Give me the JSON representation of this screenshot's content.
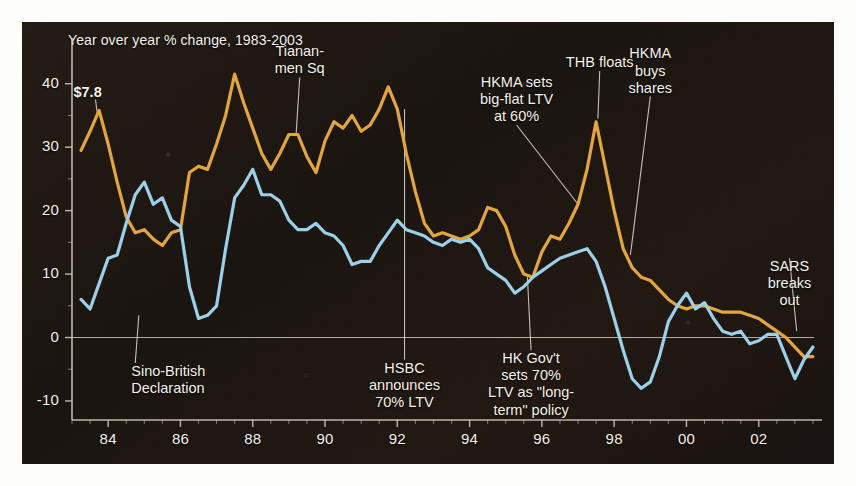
{
  "chart_data": {
    "type": "line",
    "title": "Year over year % change, 1983-2003",
    "xlabel": "",
    "ylabel": "",
    "xlim": [
      1983.0,
      2003.75
    ],
    "ylim": [
      -13,
      45
    ],
    "yticks": [
      40,
      30,
      20,
      10,
      0,
      -10
    ],
    "ytick_labels": [
      "40",
      "30",
      "20",
      "10",
      "0",
      "-10"
    ],
    "xticks": [
      1984,
      1986,
      1988,
      1990,
      1992,
      1994,
      1996,
      1998,
      2000,
      2002
    ],
    "xtick_labels": [
      "84",
      "86",
      "88",
      "90",
      "92",
      "94",
      "96",
      "98",
      "00",
      "02"
    ],
    "grid": false,
    "zero_line": true,
    "legend": "none",
    "colors": {
      "series_gold": "#e3a63e",
      "series_blue": "#9ccfe8",
      "background": "#1c1510",
      "axis": "#cfc8bd",
      "text": "#f4f1ea"
    },
    "series": [
      {
        "name": "gold-series",
        "color": "#e3a63e",
        "x": [
          1983.25,
          1983.5,
          1983.75,
          1984.0,
          1984.25,
          1984.5,
          1984.75,
          1985.0,
          1985.25,
          1985.5,
          1985.75,
          1986.0,
          1986.25,
          1986.5,
          1986.75,
          1987.0,
          1987.25,
          1987.5,
          1987.75,
          1988.0,
          1988.25,
          1988.5,
          1988.75,
          1989.0,
          1989.25,
          1989.5,
          1989.75,
          1990.0,
          1990.25,
          1990.5,
          1990.75,
          1991.0,
          1991.25,
          1991.5,
          1991.75,
          1992.0,
          1992.25,
          1992.5,
          1992.75,
          1993.0,
          1993.25,
          1993.5,
          1993.75,
          1994.0,
          1994.25,
          1994.5,
          1994.75,
          1995.0,
          1995.25,
          1995.5,
          1995.75,
          1996.0,
          1996.25,
          1996.5,
          1996.75,
          1997.0,
          1997.25,
          1997.5,
          1997.75,
          1998.0,
          1998.25,
          1998.5,
          1998.75,
          1999.0,
          1999.25,
          1999.5,
          1999.75,
          2000.0,
          2000.25,
          2000.5,
          2000.75,
          2001.0,
          2001.25,
          2001.5,
          2001.75,
          2002.0,
          2002.25,
          2002.5,
          2002.75,
          2003.0,
          2003.25,
          2003.5
        ],
        "y": [
          29.5,
          32.5,
          35.8,
          30.5,
          24.5,
          19.0,
          16.5,
          17.0,
          15.5,
          14.5,
          16.5,
          17.0,
          26.0,
          27.0,
          26.5,
          30.5,
          35.0,
          41.5,
          37.0,
          33.0,
          29.0,
          26.5,
          29.0,
          32.0,
          32.0,
          28.5,
          26.0,
          31.0,
          34.0,
          33.0,
          35.0,
          32.5,
          33.5,
          36.0,
          39.5,
          36.0,
          29.0,
          23.0,
          18.0,
          16.0,
          16.5,
          16.0,
          15.5,
          16.0,
          17.0,
          20.5,
          20.0,
          17.5,
          13.0,
          10.0,
          9.5,
          13.5,
          16.0,
          15.5,
          18.0,
          21.0,
          26.5,
          34.0,
          27.0,
          20.0,
          14.0,
          11.0,
          9.5,
          9.0,
          7.5,
          6.0,
          5.0,
          4.5,
          5.0,
          5.0,
          4.5,
          4.0,
          4.0,
          4.0,
          3.5,
          3.0,
          2.0,
          1.0,
          0.0,
          -1.5,
          -3.0,
          -3.0
        ]
      },
      {
        "name": "blue-series",
        "color": "#9ccfe8",
        "x": [
          1983.25,
          1983.5,
          1983.75,
          1984.0,
          1984.25,
          1984.5,
          1984.75,
          1985.0,
          1985.25,
          1985.5,
          1985.75,
          1986.0,
          1986.25,
          1986.5,
          1986.75,
          1987.0,
          1987.25,
          1987.5,
          1987.75,
          1988.0,
          1988.25,
          1988.5,
          1988.75,
          1989.0,
          1989.25,
          1989.5,
          1989.75,
          1990.0,
          1990.25,
          1990.5,
          1990.75,
          1991.0,
          1991.25,
          1991.5,
          1991.75,
          1992.0,
          1992.25,
          1992.5,
          1992.75,
          1993.0,
          1993.25,
          1993.5,
          1993.75,
          1994.0,
          1994.25,
          1994.5,
          1994.75,
          1995.0,
          1995.25,
          1995.5,
          1995.75,
          1996.0,
          1996.25,
          1996.5,
          1996.75,
          1997.0,
          1997.25,
          1997.5,
          1997.75,
          1998.0,
          1998.25,
          1998.5,
          1998.75,
          1999.0,
          1999.25,
          1999.5,
          1999.75,
          2000.0,
          2000.25,
          2000.5,
          2000.75,
          2001.0,
          2001.25,
          2001.5,
          2001.75,
          2002.0,
          2002.25,
          2002.5,
          2002.75,
          2003.0,
          2003.25,
          2003.5
        ],
        "y": [
          6.0,
          4.5,
          8.5,
          12.5,
          13.0,
          18.0,
          22.5,
          24.5,
          21.0,
          22.0,
          18.5,
          17.5,
          8.0,
          3.0,
          3.5,
          5.0,
          14.0,
          22.0,
          24.0,
          26.5,
          22.5,
          22.5,
          21.5,
          18.5,
          17.0,
          17.0,
          18.0,
          16.5,
          16.0,
          14.5,
          11.5,
          12.0,
          12.0,
          14.5,
          16.5,
          18.5,
          17.0,
          16.5,
          16.0,
          15.0,
          14.5,
          15.5,
          15.0,
          15.5,
          14.0,
          11.0,
          10.0,
          9.0,
          7.0,
          8.0,
          9.5,
          10.5,
          11.5,
          12.5,
          13.0,
          13.5,
          14.0,
          12.0,
          8.0,
          3.0,
          -2.0,
          -6.5,
          -8.0,
          -7.0,
          -3.0,
          2.5,
          5.0,
          7.0,
          4.5,
          5.5,
          3.0,
          1.0,
          0.5,
          1.0,
          -1.0,
          -0.5,
          0.5,
          0.5,
          -3.0,
          -6.5,
          -3.5,
          -1.5
        ]
      }
    ],
    "value_labels": [
      {
        "text": "$7.8",
        "x": 1983.65,
        "y": 38.5
      }
    ],
    "annotations": [
      {
        "id": "sino-british-declaration",
        "text": "Sino-British\nDeclaration",
        "align": "left",
        "label_x": 1984.75,
        "label_y": -4.0,
        "point_x": 1984.85,
        "point_y": 3.5
      },
      {
        "id": "tiananmen-square",
        "text": "Tianan-\nmen Sq",
        "align": "center",
        "label_x": 1989.3,
        "label_y": 41.0,
        "point_x": 1989.2,
        "point_y": 32.0
      },
      {
        "id": "hsbc-announces-70-ltv",
        "text": "HSBC\nannounces\n70% LTV",
        "align": "center",
        "label_x": 1992.2,
        "label_y": -3.5,
        "point_x": 1992.2,
        "point_y": 36.0
      },
      {
        "id": "hkma-sets-big-flat-ltv-60",
        "text": "HKMA sets\nbig-flat LTV\nat 60%",
        "align": "center",
        "label_x": 1995.3,
        "label_y": 33.5,
        "point_x": 1997.0,
        "point_y": 21.0
      },
      {
        "id": "hk-govt-sets-70-ltv-long-term",
        "text": "HK Gov't\nsets 70%\nLTV as \"long-\nterm\" policy",
        "align": "center",
        "label_x": 1995.7,
        "label_y": -2.0,
        "point_x": 1995.6,
        "point_y": 9.5
      },
      {
        "id": "thb-floats",
        "text": "THB floats",
        "align": "center",
        "label_x": 1997.6,
        "label_y": 42.0,
        "point_x": 1997.55,
        "point_y": 34.5
      },
      {
        "id": "hkma-buys-shares",
        "text": "HKMA\nbuys\nshares",
        "align": "center",
        "label_x": 1999.0,
        "label_y": 38.0,
        "point_x": 1998.45,
        "point_y": 13.0
      },
      {
        "id": "sars-breaks-out",
        "text": "SARS\nbreaks\nout",
        "align": "center",
        "label_x": 2002.85,
        "label_y": 12.5,
        "point_x": 2003.05,
        "point_y": 1.0
      }
    ]
  }
}
